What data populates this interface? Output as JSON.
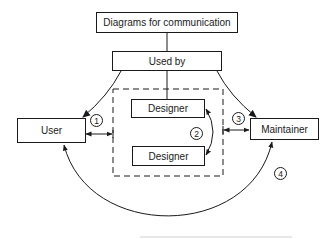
{
  "diagram": {
    "title_box": "Diagrams for communication",
    "used_by_box": "Used by",
    "nodes": {
      "user": "User",
      "designer_1": "Designer",
      "designer_2": "Designer",
      "maintainer": "Maintainer"
    },
    "markers": [
      "1",
      "2",
      "3",
      "4"
    ],
    "edges": [
      {
        "from": "Diagrams for communication",
        "to": "Used by",
        "type": "line"
      },
      {
        "from": "Used by",
        "to": "Designer",
        "type": "line"
      },
      {
        "from": "Used by",
        "to": "User",
        "type": "arrow"
      },
      {
        "from": "Used by",
        "to": "Maintainer",
        "type": "arrow"
      },
      {
        "from": "User",
        "to": "Designer group",
        "type": "double-arrow",
        "label": "1"
      },
      {
        "from": "Designer",
        "to": "Designer",
        "type": "double-arrow-curve",
        "label": "2"
      },
      {
        "from": "Designer group",
        "to": "Maintainer",
        "type": "double-arrow",
        "label": "3"
      },
      {
        "from": "User",
        "to": "Maintainer",
        "type": "double-arrow-arc",
        "label": "4"
      }
    ],
    "group": "Designers (dashed boundary)"
  }
}
